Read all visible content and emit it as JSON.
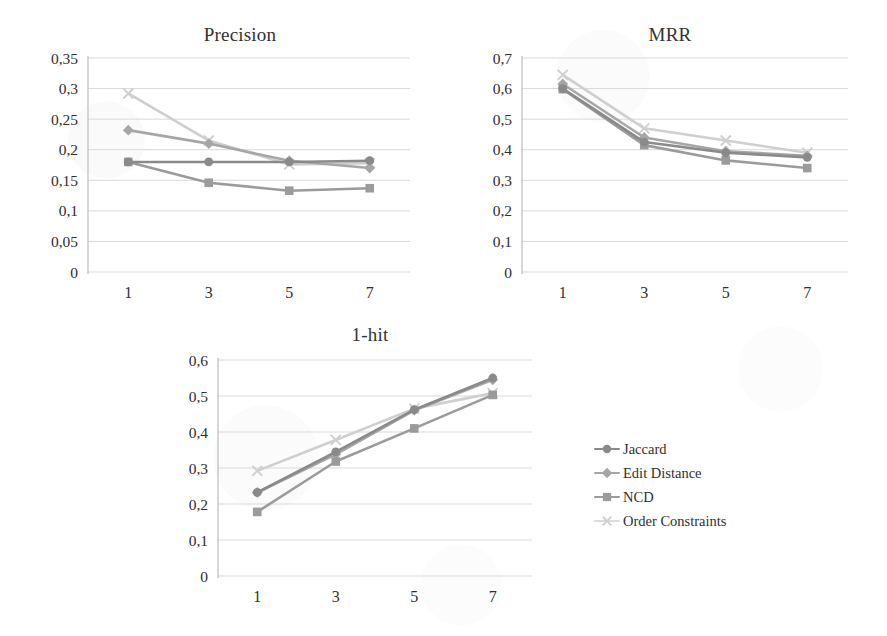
{
  "figure": {
    "legend": {
      "position": "right-middle",
      "entries": [
        {
          "label": "Jaccard",
          "marker": "circle",
          "color": "#8a8a8a"
        },
        {
          "label": "Edit Distance",
          "marker": "diamond",
          "color": "#a6a6a6"
        },
        {
          "label": "NCD",
          "marker": "square",
          "color": "#9b9b9b"
        },
        {
          "label": "Order Constraints",
          "marker": "cross",
          "color": "#cfcfcf"
        }
      ]
    }
  },
  "chart_data": [
    {
      "type": "line",
      "title": "Precision",
      "xlabel": "",
      "ylabel": "",
      "x": [
        1,
        3,
        5,
        7
      ],
      "xtick_labels": [
        "1",
        "3",
        "5",
        "7"
      ],
      "ylim": [
        0,
        0.35
      ],
      "yticks": [
        0,
        0.05,
        0.1,
        0.15,
        0.2,
        0.25,
        0.3,
        0.35
      ],
      "ytick_labels": [
        "0",
        "0,05",
        "0,1",
        "0,15",
        "0,2",
        "0,25",
        "0,3",
        "0,35"
      ],
      "grid": true,
      "series": [
        {
          "name": "Jaccard",
          "marker": "circle",
          "color": "#8a8a8a",
          "values": [
            0.18,
            0.18,
            0.18,
            0.182
          ]
        },
        {
          "name": "Edit Distance",
          "marker": "diamond",
          "color": "#a6a6a6",
          "values": [
            0.232,
            0.21,
            0.182,
            0.17
          ]
        },
        {
          "name": "NCD",
          "marker": "square",
          "color": "#9b9b9b",
          "values": [
            0.18,
            0.146,
            0.133,
            0.137
          ]
        },
        {
          "name": "Order Constraints",
          "marker": "cross",
          "color": "#cfcfcf",
          "values": [
            0.292,
            0.215,
            0.176,
            0.178
          ]
        }
      ]
    },
    {
      "type": "line",
      "title": "MRR",
      "xlabel": "",
      "ylabel": "",
      "x": [
        1,
        3,
        5,
        7
      ],
      "xtick_labels": [
        "1",
        "3",
        "5",
        "7"
      ],
      "ylim": [
        0,
        0.7
      ],
      "yticks": [
        0,
        0.1,
        0.2,
        0.3,
        0.4,
        0.5,
        0.6,
        0.7
      ],
      "ytick_labels": [
        "0",
        "0,1",
        "0,2",
        "0,3",
        "0,4",
        "0,5",
        "0,6",
        "0,7"
      ],
      "grid": true,
      "series": [
        {
          "name": "Jaccard",
          "marker": "circle",
          "color": "#8a8a8a",
          "values": [
            0.6,
            0.425,
            0.39,
            0.375
          ]
        },
        {
          "name": "Edit Distance",
          "marker": "diamond",
          "color": "#a6a6a6",
          "values": [
            0.615,
            0.44,
            0.395,
            0.38
          ]
        },
        {
          "name": "NCD",
          "marker": "square",
          "color": "#9b9b9b",
          "values": [
            0.598,
            0.415,
            0.365,
            0.34
          ]
        },
        {
          "name": "Order Constraints",
          "marker": "cross",
          "color": "#cfcfcf",
          "values": [
            0.645,
            0.47,
            0.43,
            0.39
          ]
        }
      ]
    },
    {
      "type": "line",
      "title": "1-hit",
      "xlabel": "",
      "ylabel": "",
      "x": [
        1,
        3,
        5,
        7
      ],
      "xtick_labels": [
        "1",
        "3",
        "5",
        "7"
      ],
      "ylim": [
        0,
        0.6
      ],
      "yticks": [
        0,
        0.1,
        0.2,
        0.3,
        0.4,
        0.5,
        0.6
      ],
      "ytick_labels": [
        "0",
        "0,1",
        "0,2",
        "0,3",
        "0,4",
        "0,5",
        "0,6"
      ],
      "grid": true,
      "series": [
        {
          "name": "Jaccard",
          "marker": "circle",
          "color": "#8a8a8a",
          "values": [
            0.232,
            0.345,
            0.462,
            0.55
          ]
        },
        {
          "name": "Edit Distance",
          "marker": "diamond",
          "color": "#a6a6a6",
          "values": [
            0.232,
            0.338,
            0.46,
            0.545
          ]
        },
        {
          "name": "NCD",
          "marker": "square",
          "color": "#9b9b9b",
          "values": [
            0.178,
            0.318,
            0.41,
            0.503
          ]
        },
        {
          "name": "Order Constraints",
          "marker": "cross",
          "color": "#cfcfcf",
          "values": [
            0.292,
            0.378,
            0.465,
            0.508
          ]
        }
      ]
    }
  ]
}
